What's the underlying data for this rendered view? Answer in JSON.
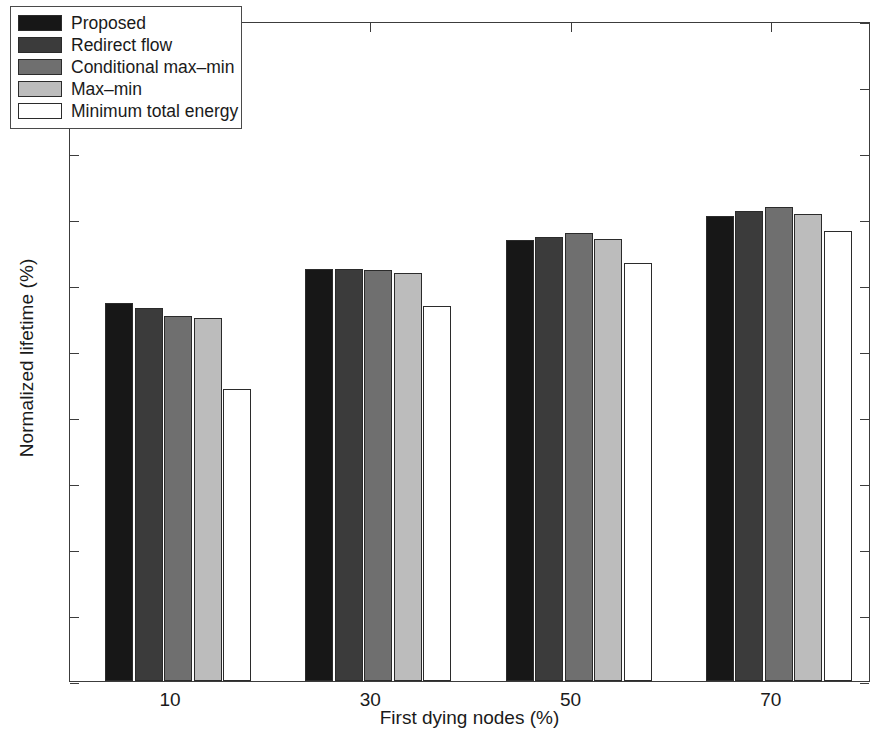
{
  "chart_data": {
    "type": "bar",
    "title": "",
    "xlabel": "First dying nodes (%)",
    "ylabel": "Normalized lifetime (%)",
    "categories": [
      "10",
      "30",
      "50",
      "70"
    ],
    "ylim": [
      0,
      100
    ],
    "yticks": [
      0,
      10,
      20,
      30,
      40,
      50,
      60,
      70,
      80,
      90,
      100
    ],
    "grid": false,
    "legend_position": "upper-left",
    "series": [
      {
        "name": "Proposed",
        "color": "#171717",
        "values": [
          57.2,
          62.5,
          66.8,
          70.4
        ]
      },
      {
        "name": "Redirect flow",
        "color": "#3b3b3b",
        "values": [
          56.5,
          62.4,
          67.2,
          71.2
        ]
      },
      {
        "name": "Conditional max-min",
        "color": "#6f6f6f",
        "values": [
          55.3,
          62.2,
          67.9,
          71.8
        ]
      },
      {
        "name": "Max-min",
        "color": "#bcbcbc",
        "values": [
          55.0,
          61.8,
          66.9,
          70.8
        ]
      },
      {
        "name": "Minimum total energy",
        "color": "#ffffff",
        "values": [
          44.3,
          56.8,
          63.3,
          68.2
        ]
      }
    ]
  },
  "legend": {
    "entries": [
      "Proposed",
      "Redirect flow",
      "Conditional max–min",
      "Max–min",
      "Minimum total energy"
    ]
  },
  "axes": {
    "y_tick_labels": [
      "100",
      "90",
      "80",
      "70",
      "60",
      "50",
      "40",
      "30",
      "20",
      "10",
      "0"
    ],
    "x_tick_labels": [
      "10",
      "30",
      "50",
      "70"
    ]
  },
  "colors": {
    "axis": "#3c3c3c",
    "bar_edge": "#2b2b2b",
    "background": "#ffffff"
  }
}
